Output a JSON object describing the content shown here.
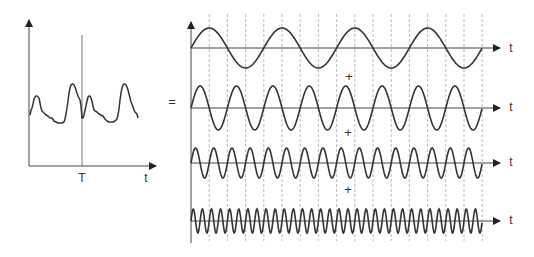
{
  "diagram": {
    "title": "",
    "colors": {
      "stroke": "#333333",
      "grid": "#999999",
      "background": "#ffffff"
    },
    "left_plot": {
      "time_axis_label": "t",
      "period_marker_label": "T",
      "signal_description": "periodic composite signal with period T"
    },
    "equals_sign": "=",
    "right_plot": {
      "components": [
        {
          "name": "fundamental",
          "axis_label": "t",
          "relative_frequency": 1
        },
        {
          "name": "2nd harmonic",
          "axis_label": "t",
          "relative_frequency": 2
        },
        {
          "name": "4th harmonic",
          "axis_label": "t",
          "relative_frequency": 4
        },
        {
          "name": "8th harmonic",
          "axis_label": "t",
          "relative_frequency": 8
        }
      ],
      "operators": [
        "+",
        "+",
        "+"
      ]
    }
  }
}
